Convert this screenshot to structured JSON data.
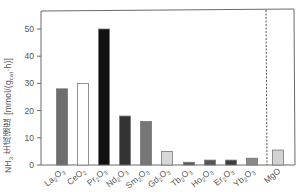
{
  "chart_data": {
    "type": "bar",
    "title": "",
    "xlabel": "",
    "ylabel": "NH3 生成速度 [mmol/(gcat·h)]",
    "ylabel_parts": {
      "main": "NH",
      "sub3": "3",
      "jp": " 生成速度 ",
      "unit_open": "[mmol/(g",
      "sub_cat": "cat",
      "unit_close": "·h)]"
    },
    "ylim": [
      0,
      55
    ],
    "yticks": [
      0,
      10,
      20,
      30,
      40,
      50
    ],
    "grid": false,
    "legend": null,
    "categories": [
      "La2O3",
      "CeO2",
      "Pr2O3",
      "Nd2O3",
      "Sm2O3",
      "Gd2O3",
      "Tb2O3",
      "Ho2O3",
      "Er2O3",
      "Yb2O3",
      "MgO"
    ],
    "category_labels": [
      {
        "base": "La",
        "sub1": "2",
        "mid": "O",
        "sub2": "3"
      },
      {
        "base": "CeO",
        "sub1": "2",
        "mid": "",
        "sub2": ""
      },
      {
        "base": "Pr",
        "sub1": "2",
        "mid": "O",
        "sub2": "3"
      },
      {
        "base": "Nd",
        "sub1": "2",
        "mid": "O",
        "sub2": "3"
      },
      {
        "base": "Sm",
        "sub1": "2",
        "mid": "O",
        "sub2": "3"
      },
      {
        "base": "Gd",
        "sub1": "2",
        "mid": "O",
        "sub2": "3"
      },
      {
        "base": "Tb",
        "sub1": "2",
        "mid": "O",
        "sub2": "3"
      },
      {
        "base": "Ho",
        "sub1": "2",
        "mid": "O",
        "sub2": "3"
      },
      {
        "base": "Er",
        "sub1": "2",
        "mid": "O",
        "sub2": "3"
      },
      {
        "base": "Yb",
        "sub1": "2",
        "mid": "O",
        "sub2": "3"
      },
      {
        "base": "MgO",
        "sub1": "",
        "mid": "",
        "sub2": ""
      }
    ],
    "values": [
      28,
      30,
      50,
      18,
      16,
      5,
      1.0,
      1.8,
      1.8,
      2.5,
      5.5
    ],
    "bar_colors": [
      "#6e6e6e",
      "#ffffff",
      "#111111",
      "#333333",
      "#777777",
      "#d8d8d8",
      "#5a5a5a",
      "#555555",
      "#3c3c3c",
      "#8a8a8a",
      "#d2d2d2"
    ],
    "annotations": [
      {
        "type": "vertical-dashed-line",
        "between": [
          "Yb2O3",
          "MgO"
        ]
      }
    ]
  },
  "colors": {
    "axis": "#6a6a6a",
    "bar_edge": "#777777",
    "text": "#555555"
  }
}
